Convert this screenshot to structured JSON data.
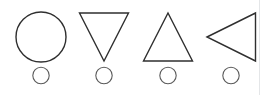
{
  "panel": {
    "name": "shape-selector",
    "width": 260,
    "height": 95,
    "background_color": "#ffffff",
    "border_color": "#e4e6e8",
    "stroke_color": "#2f2f2f",
    "radio_stroke_color": "#5a5a5a"
  },
  "options": [
    {
      "id": "circle",
      "icon": "circle-outline-icon",
      "label": "Circle",
      "selected": false,
      "radio_label": "",
      "center_x": 41,
      "center_y": 37,
      "size": 50
    },
    {
      "id": "triangle-down",
      "icon": "triangle-down-outline-icon",
      "label": "Triangle Down",
      "selected": false,
      "radio_label": "",
      "center_x": 104,
      "center_y": 37,
      "size": 50
    },
    {
      "id": "triangle-up",
      "icon": "triangle-up-outline-icon",
      "label": "Triangle Up",
      "selected": false,
      "radio_label": "",
      "center_x": 168,
      "center_y": 37,
      "size": 50
    },
    {
      "id": "triangle-left",
      "icon": "triangle-left-outline-icon",
      "label": "Triangle Left",
      "selected": false,
      "radio_label": "",
      "center_x": 231,
      "center_y": 37,
      "size": 50
    }
  ]
}
